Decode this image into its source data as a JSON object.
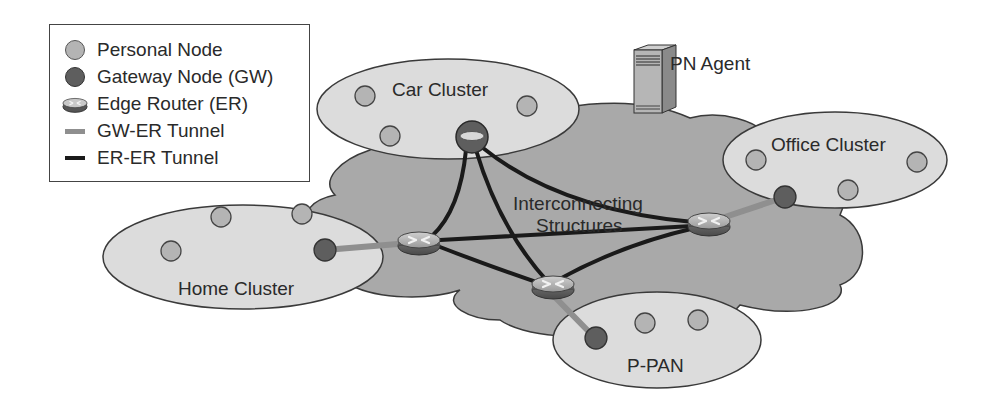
{
  "legend": {
    "items": [
      {
        "label": "Personal Node",
        "symbol": "light-gray-circle"
      },
      {
        "label": "Gateway Node (GW)",
        "symbol": "dark-gray-circle"
      },
      {
        "label": "Edge Router (ER)",
        "symbol": "router-disk"
      },
      {
        "label": "GW-ER Tunnel",
        "symbol": "gray-line"
      },
      {
        "label": "ER-ER Tunnel",
        "symbol": "black-line"
      }
    ]
  },
  "agent": {
    "label": "PN Agent",
    "icon": "server-tower-icon"
  },
  "core": {
    "label_line1": "Interconnecting",
    "label_line2": "Structures"
  },
  "clusters": {
    "car": {
      "label": "Car Cluster"
    },
    "office": {
      "label": "Office Cluster"
    },
    "home": {
      "label": "Home Cluster"
    },
    "ppan": {
      "label": "P-PAN"
    }
  },
  "colors": {
    "personal_node": "#b4b4b4",
    "gateway_node": "#5e5e5e",
    "cluster_fill": "#dcdcdc",
    "cloud_fill": "#a9a9a9",
    "gw_er_tunnel": "#8f8f8f",
    "er_er_tunnel": "#1a1a1a"
  }
}
